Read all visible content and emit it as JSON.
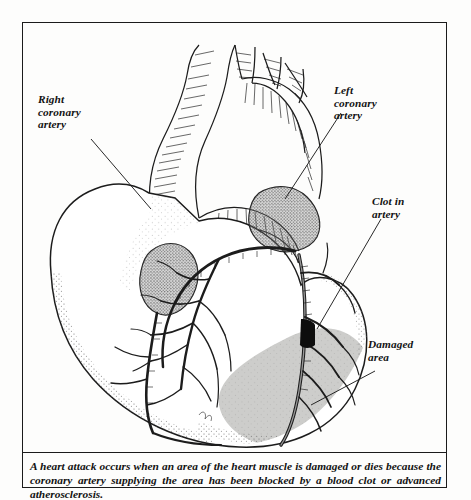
{
  "figure": {
    "style": "black and white pen-and-ink line engraving",
    "labels": [
      {
        "id": "right-coronary-artery",
        "text": "Right\ncoronary\nartery"
      },
      {
        "id": "left-coronary-artery",
        "text": "Left\ncoronary\nartery"
      },
      {
        "id": "clot-in-artery",
        "text": "Clot in\nartery"
      },
      {
        "id": "damaged-area",
        "text": "Damaged\narea"
      }
    ],
    "colors": {
      "ink": "#1b1b1b",
      "paper": "#fdfdfc",
      "damaged_area_fill": "#c9c9c7",
      "clot_fill": "#0d0d0d",
      "stipple": "#5a5a5a"
    }
  },
  "caption": {
    "text": "A heart attack occurs when an area of the heart muscle is damaged or dies because the coronary artery supplying the area has been blocked by a blood clot or advanced atherosclerosis."
  }
}
